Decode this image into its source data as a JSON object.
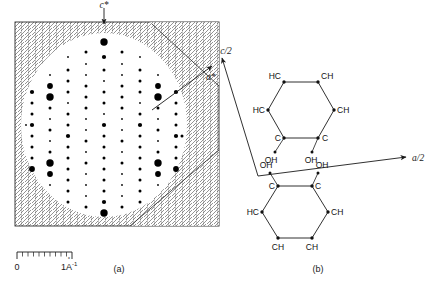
{
  "figure": {
    "panels": [
      {
        "id": "a",
        "label": "(a)",
        "caption_role": "diffraction-pattern"
      },
      {
        "id": "b",
        "label": "(b)",
        "caption_role": "molecular-structure"
      }
    ]
  },
  "panel_a": {
    "axis_labels": {
      "vertical": "c*",
      "diagonal": "a*"
    },
    "scale_bar": {
      "zero_label": "0",
      "unit_label": "1A",
      "unit_exponent": "-1",
      "unit_ring": "°",
      "tick_count": 10,
      "major_tick_index": 10
    },
    "background": "cross-hatched",
    "aperture": "circular"
  },
  "panel_b": {
    "vectors": [
      {
        "name": "c/2",
        "label": "c/2"
      },
      {
        "name": "a/2",
        "label": "a/2"
      }
    ],
    "molecules": [
      {
        "name": "hydroquinone-upper",
        "ring_labels": [
          "HC",
          "CH",
          "CH",
          "C",
          "C",
          "HC"
        ],
        "substituents": [
          "OH",
          "OH"
        ]
      },
      {
        "name": "hydroquinone-lower",
        "ring_labels": [
          "C",
          "C",
          "CH",
          "CH",
          "CH",
          "HC"
        ],
        "substituents": [
          "OH",
          "OH"
        ]
      }
    ]
  },
  "chart_data": {
    "type": "scatter",
    "title": "",
    "xlabel": "a*",
    "ylabel": "c*",
    "grid": false,
    "legend": "none",
    "intensity_scale": {
      "min": 1,
      "max": 5,
      "units": "relative spot radius"
    },
    "spots": [
      {
        "x": 104,
        "y": 42,
        "i": 5
      },
      {
        "x": 86,
        "y": 52,
        "i": 2
      },
      {
        "x": 122,
        "y": 52,
        "i": 2
      },
      {
        "x": 68,
        "y": 57,
        "i": 1
      },
      {
        "x": 104,
        "y": 57,
        "i": 3
      },
      {
        "x": 140,
        "y": 57,
        "i": 1
      },
      {
        "x": 86,
        "y": 64,
        "i": 1
      },
      {
        "x": 122,
        "y": 64,
        "i": 1
      },
      {
        "x": 68,
        "y": 70,
        "i": 2
      },
      {
        "x": 104,
        "y": 70,
        "i": 2
      },
      {
        "x": 140,
        "y": 70,
        "i": 2
      },
      {
        "x": 50,
        "y": 75,
        "i": 1
      },
      {
        "x": 86,
        "y": 75,
        "i": 1
      },
      {
        "x": 122,
        "y": 75,
        "i": 1
      },
      {
        "x": 158,
        "y": 75,
        "i": 1
      },
      {
        "x": 68,
        "y": 81,
        "i": 2
      },
      {
        "x": 104,
        "y": 81,
        "i": 1
      },
      {
        "x": 140,
        "y": 81,
        "i": 2
      },
      {
        "x": 50,
        "y": 86,
        "i": 4
      },
      {
        "x": 86,
        "y": 86,
        "i": 2
      },
      {
        "x": 122,
        "y": 86,
        "i": 2
      },
      {
        "x": 158,
        "y": 86,
        "i": 4
      },
      {
        "x": 32,
        "y": 92,
        "i": 3
      },
      {
        "x": 68,
        "y": 92,
        "i": 2
      },
      {
        "x": 104,
        "y": 92,
        "i": 2
      },
      {
        "x": 140,
        "y": 92,
        "i": 2
      },
      {
        "x": 176,
        "y": 92,
        "i": 3
      },
      {
        "x": 50,
        "y": 97,
        "i": 5
      },
      {
        "x": 86,
        "y": 97,
        "i": 2
      },
      {
        "x": 122,
        "y": 97,
        "i": 2
      },
      {
        "x": 158,
        "y": 97,
        "i": 5
      },
      {
        "x": 32,
        "y": 103,
        "i": 2
      },
      {
        "x": 68,
        "y": 103,
        "i": 1
      },
      {
        "x": 104,
        "y": 103,
        "i": 2
      },
      {
        "x": 140,
        "y": 103,
        "i": 1
      },
      {
        "x": 176,
        "y": 103,
        "i": 2
      },
      {
        "x": 50,
        "y": 108,
        "i": 2
      },
      {
        "x": 86,
        "y": 108,
        "i": 2
      },
      {
        "x": 122,
        "y": 108,
        "i": 2
      },
      {
        "x": 158,
        "y": 108,
        "i": 2
      },
      {
        "x": 32,
        "y": 114,
        "i": 2
      },
      {
        "x": 68,
        "y": 114,
        "i": 2
      },
      {
        "x": 104,
        "y": 114,
        "i": 1
      },
      {
        "x": 140,
        "y": 114,
        "i": 2
      },
      {
        "x": 176,
        "y": 114,
        "i": 2
      },
      {
        "x": 50,
        "y": 119,
        "i": 1
      },
      {
        "x": 86,
        "y": 119,
        "i": 1
      },
      {
        "x": 122,
        "y": 119,
        "i": 1
      },
      {
        "x": 158,
        "y": 119,
        "i": 1
      },
      {
        "x": 26,
        "y": 125,
        "i": 1
      },
      {
        "x": 32,
        "y": 125,
        "i": 3
      },
      {
        "x": 68,
        "y": 125,
        "i": 2
      },
      {
        "x": 104,
        "y": 125,
        "i": 3
      },
      {
        "x": 140,
        "y": 125,
        "i": 3
      },
      {
        "x": 176,
        "y": 125,
        "i": 2
      },
      {
        "x": 50,
        "y": 130,
        "i": 2
      },
      {
        "x": 86,
        "y": 130,
        "i": 1
      },
      {
        "x": 122,
        "y": 130,
        "i": 1
      },
      {
        "x": 158,
        "y": 130,
        "i": 2
      },
      {
        "x": 32,
        "y": 136,
        "i": 2
      },
      {
        "x": 68,
        "y": 136,
        "i": 3
      },
      {
        "x": 104,
        "y": 136,
        "i": 2
      },
      {
        "x": 140,
        "y": 136,
        "i": 2
      },
      {
        "x": 176,
        "y": 136,
        "i": 3
      },
      {
        "x": 182,
        "y": 136,
        "i": 2
      },
      {
        "x": 50,
        "y": 141,
        "i": 1
      },
      {
        "x": 86,
        "y": 141,
        "i": 2
      },
      {
        "x": 122,
        "y": 141,
        "i": 2
      },
      {
        "x": 158,
        "y": 141,
        "i": 1
      },
      {
        "x": 32,
        "y": 147,
        "i": 2
      },
      {
        "x": 68,
        "y": 147,
        "i": 2
      },
      {
        "x": 104,
        "y": 147,
        "i": 2
      },
      {
        "x": 140,
        "y": 147,
        "i": 2
      },
      {
        "x": 176,
        "y": 147,
        "i": 2
      },
      {
        "x": 50,
        "y": 152,
        "i": 2
      },
      {
        "x": 86,
        "y": 152,
        "i": 1
      },
      {
        "x": 122,
        "y": 152,
        "i": 1
      },
      {
        "x": 158,
        "y": 152,
        "i": 2
      },
      {
        "x": 32,
        "y": 158,
        "i": 2
      },
      {
        "x": 68,
        "y": 158,
        "i": 2
      },
      {
        "x": 104,
        "y": 158,
        "i": 2
      },
      {
        "x": 140,
        "y": 158,
        "i": 2
      },
      {
        "x": 176,
        "y": 158,
        "i": 2
      },
      {
        "x": 50,
        "y": 163,
        "i": 5
      },
      {
        "x": 86,
        "y": 163,
        "i": 2
      },
      {
        "x": 122,
        "y": 163,
        "i": 2
      },
      {
        "x": 158,
        "y": 163,
        "i": 5
      },
      {
        "x": 32,
        "y": 169,
        "i": 4
      },
      {
        "x": 68,
        "y": 169,
        "i": 2
      },
      {
        "x": 104,
        "y": 169,
        "i": 2
      },
      {
        "x": 140,
        "y": 169,
        "i": 2
      },
      {
        "x": 176,
        "y": 169,
        "i": 4
      },
      {
        "x": 50,
        "y": 174,
        "i": 4
      },
      {
        "x": 86,
        "y": 174,
        "i": 1
      },
      {
        "x": 122,
        "y": 174,
        "i": 1
      },
      {
        "x": 158,
        "y": 174,
        "i": 4
      },
      {
        "x": 68,
        "y": 180,
        "i": 2
      },
      {
        "x": 104,
        "y": 180,
        "i": 2
      },
      {
        "x": 140,
        "y": 180,
        "i": 2
      },
      {
        "x": 50,
        "y": 185,
        "i": 1
      },
      {
        "x": 86,
        "y": 185,
        "i": 1
      },
      {
        "x": 122,
        "y": 185,
        "i": 1
      },
      {
        "x": 158,
        "y": 185,
        "i": 1
      },
      {
        "x": 68,
        "y": 191,
        "i": 2
      },
      {
        "x": 104,
        "y": 191,
        "i": 2
      },
      {
        "x": 140,
        "y": 191,
        "i": 2
      },
      {
        "x": 86,
        "y": 196,
        "i": 1
      },
      {
        "x": 122,
        "y": 196,
        "i": 1
      },
      {
        "x": 68,
        "y": 202,
        "i": 2
      },
      {
        "x": 104,
        "y": 202,
        "i": 3
      },
      {
        "x": 140,
        "y": 202,
        "i": 2
      },
      {
        "x": 86,
        "y": 207,
        "i": 2
      },
      {
        "x": 122,
        "y": 207,
        "i": 2
      },
      {
        "x": 104,
        "y": 213,
        "i": 5
      }
    ]
  }
}
